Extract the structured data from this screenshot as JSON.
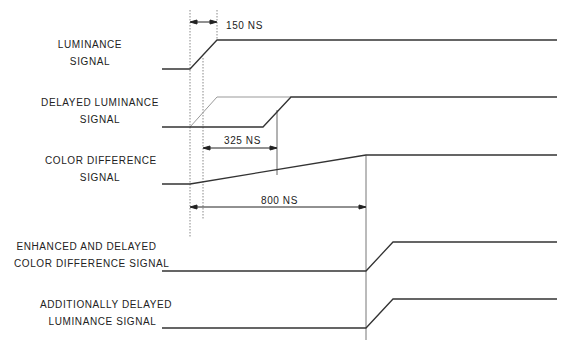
{
  "diagram": {
    "type": "timing-diagram",
    "signals": [
      {
        "label_line1": "LUMINANCE",
        "label_line2": "SIGNAL"
      },
      {
        "label_line1": "DELAYED LUMINANCE",
        "label_line2": "SIGNAL"
      },
      {
        "label_line1": "COLOR DIFFERENCE",
        "label_line2": "SIGNAL"
      },
      {
        "label_line1": "ENHANCED AND DELAYED",
        "label_line2": "COLOR DIFFERENCE SIGNAL"
      },
      {
        "label_line1": "ADDITIONALLY DELAYED",
        "label_line2": "LUMINANCE SIGNAL"
      }
    ],
    "dimensions": {
      "rise_time": "150 NS",
      "delay": "325 NS",
      "color_rise_time": "800 NS"
    },
    "colors": {
      "line": "#333333",
      "guide": "#999999",
      "text": "#222222"
    }
  }
}
